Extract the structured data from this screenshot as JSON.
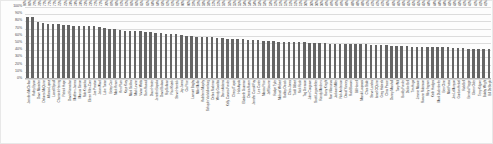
{
  "chart_data": {
    "type": "bar",
    "title": "",
    "subtitle": "",
    "xlabel": "",
    "ylabel": "",
    "ylim": [
      0,
      1
    ],
    "grid": true,
    "legend": false,
    "legend_position": "none",
    "bar_color": "#646464",
    "gridline_color": "#dcdcdc",
    "y_ticks": [
      "100%",
      "90%",
      "80%",
      "70%",
      "60%",
      "50%",
      "40%",
      "30%",
      "20%",
      "10%",
      "0%"
    ],
    "y_tick_values": [
      1.0,
      0.9,
      0.8,
      0.7,
      0.6,
      0.5,
      0.4,
      0.3,
      0.2,
      0.1,
      0.0
    ],
    "categories": [
      "Jennifer McClellan",
      "Kathy Byron",
      "Dave Marsden",
      "Delores McQuinn",
      "Alfonso Lopez",
      "Lionell Spruill",
      "Charniele Herring",
      "Patrick Hope",
      "David Ramadan",
      "Matthew James",
      "Marcus Simon",
      "Rob Krupicka",
      "Eileen Filler-Corn",
      "Joe Preston",
      "Jeion Ward",
      "Luke Torian",
      "Betsy Carr",
      "Mark Keam",
      "Ken Plum",
      "Kaye Kory",
      "Mark Sickles",
      "Mark Levine",
      "Vivian Watts",
      "Sam Rasoul",
      "Daun Hester",
      "Jennifer Boysko",
      "David Bulova",
      "Rip Sullivan",
      "Paul Krizek",
      "Steve Heretick",
      "Jay Jones",
      "Cia Price",
      "Lamont Bagby",
      "Mike Mullin",
      "Kathleen Murphy",
      "Schuyler VanValkenburg",
      "Debra Rodman",
      "Wendy Gooditis",
      "Dawn Adams",
      "Kelly Convirs-Fowler",
      "Cheryl Turpin",
      "Hala Ayala",
      "Elizabeth Guzman",
      "Danica Roem",
      "Jennifer Carroll Foy",
      "Lee Carter",
      "Marcia Price",
      "Jeff Bourne",
      "Roslyn Tyler",
      "Michael Webert",
      "Bobby Orrock",
      "Chris Jones",
      "Todd Gilbert",
      "Nick Rush",
      "Tag Greason",
      "John Cosgrove",
      "Scott Lingamfelter",
      "Randy Minchew",
      "Barry Knight",
      "Ron Villanueva",
      "Jackson Miller",
      "Rick Anderson",
      "David Yancey",
      "Rob Bloxom",
      "Bill Howell",
      "Manoli Loupassi",
      "Chris Stolle",
      "Steve Landes",
      "Israel O'Quinn",
      "Greg Habeeb",
      "Chris Peace",
      "Danny Marshall",
      "Tony Wilt",
      "Buddy Fowler",
      "Dickie Bell",
      "Tim Hugo",
      "Jimmie Massie",
      "Roxann Robinson",
      "Riley Ingram",
      "Keith Hodges",
      "Mark Dudenhefer",
      "Ben Cline",
      "Matt Fariss",
      "Jim LeMunyon",
      "Gordon Helsel",
      "Rob Bell",
      "Brenda Pogge",
      "Glenn Oder",
      "Terry Kilgore",
      "Bobby Wright",
      "Bill DeSteph"
    ],
    "values": [
      0.86,
      0.86,
      0.79,
      0.78,
      0.77,
      0.77,
      0.77,
      0.75,
      0.75,
      0.74,
      0.74,
      0.74,
      0.73,
      0.73,
      0.72,
      0.71,
      0.7,
      0.69,
      0.68,
      0.67,
      0.67,
      0.66,
      0.66,
      0.65,
      0.65,
      0.64,
      0.64,
      0.63,
      0.62,
      0.62,
      0.61,
      0.6,
      0.6,
      0.59,
      0.59,
      0.58,
      0.58,
      0.57,
      0.57,
      0.56,
      0.56,
      0.55,
      0.55,
      0.54,
      0.54,
      0.54,
      0.53,
      0.53,
      0.53,
      0.52,
      0.52,
      0.52,
      0.51,
      0.51,
      0.51,
      0.5,
      0.5,
      0.5,
      0.5,
      0.49,
      0.49,
      0.49,
      0.49,
      0.48,
      0.48,
      0.48,
      0.48,
      0.47,
      0.47,
      0.47,
      0.47,
      0.46,
      0.46,
      0.46,
      0.46,
      0.45,
      0.45,
      0.45,
      0.45,
      0.44,
      0.44,
      0.44,
      0.44,
      0.43,
      0.43,
      0.43,
      0.42,
      0.42,
      0.42,
      0.41,
      0.41
    ],
    "data_labels": [
      "86%",
      "86%",
      "79%",
      "78%",
      "77%",
      "77%",
      "77%",
      "75%",
      "75%",
      "74%",
      "74%",
      "74%",
      "73%",
      "73%",
      "72%",
      "71%",
      "70%",
      "69%",
      "68%",
      "67%",
      "67%",
      "66%",
      "66%",
      "65%",
      "65%",
      "64%",
      "64%",
      "63%",
      "62%",
      "62%",
      "61%",
      "60%",
      "60%",
      "59%",
      "59%",
      "58%",
      "58%",
      "57%",
      "57%",
      "56%",
      "56%",
      "55%",
      "55%",
      "54%",
      "54%",
      "54%",
      "53%",
      "53%",
      "53%",
      "52%",
      "52%",
      "52%",
      "51%",
      "51%",
      "51%",
      "50%",
      "50%",
      "50%",
      "50%",
      "49%",
      "49%",
      "49%",
      "49%",
      "48%",
      "48%",
      "48%",
      "48%",
      "47%",
      "47%",
      "47%",
      "47%",
      "46%",
      "46%",
      "46%",
      "46%",
      "45%",
      "45%",
      "45%",
      "45%",
      "44%",
      "44%",
      "44%",
      "44%",
      "43%",
      "43%",
      "43%",
      "42%",
      "42%",
      "42%",
      "41%",
      "41%"
    ]
  }
}
